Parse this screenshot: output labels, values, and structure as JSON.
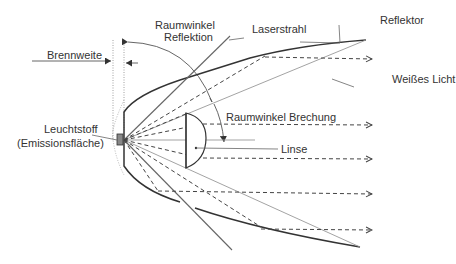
{
  "diagram": {
    "labels": {
      "raumwinkel_reflektion_1": "Raumwinkel",
      "raumwinkel_reflektion_2": "Reflektion",
      "laserstrahl": "Laserstrahl",
      "reflektor": "Reflektor",
      "brennweite": "Brennweite",
      "weisses_licht": "Weißes Licht",
      "raumwinkel_brechung": "Raumwinkel Brechung",
      "leuchtstoff_1": "Leuchtstoff",
      "leuchtstoff_2": "(Emissionsfläche)",
      "linse": "Linse"
    },
    "colors": {
      "line": "#444444",
      "light_line": "#999999",
      "text": "#333333"
    }
  }
}
